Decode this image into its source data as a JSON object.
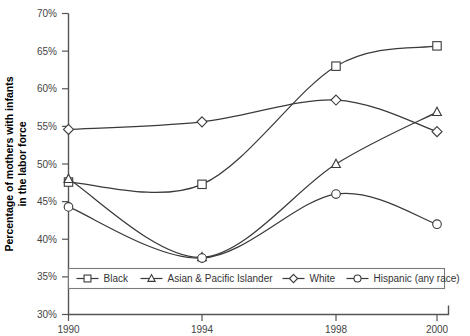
{
  "chart_data": {
    "type": "line",
    "title": "",
    "xlabel": "",
    "ylabel": "Percentage of mothers with infants in the labor force",
    "ylabel_line1": "Percentage of mothers with infants",
    "ylabel_line2": "in the labor force",
    "x": [
      1990,
      1994,
      1998,
      2000
    ],
    "categories": [
      "1990",
      "1994",
      "1998",
      "2000"
    ],
    "xtick_labels": [
      "1990",
      "1994",
      "1998",
      "2000"
    ],
    "ytick_labels": [
      "30%",
      "35%",
      "40%",
      "45%",
      "50%",
      "55%",
      "60%",
      "65%",
      "70%"
    ],
    "ytick_values": [
      30,
      35,
      40,
      45,
      50,
      55,
      60,
      65,
      70
    ],
    "ylim": [
      30,
      70
    ],
    "xlim": [
      1989.2,
      2000.6
    ],
    "grid": false,
    "legend_position": "bottom",
    "series": [
      {
        "name": "Black",
        "marker": "square",
        "values": [
          47.6,
          47.3,
          63.0,
          65.7
        ]
      },
      {
        "name": "Asian & Pacific Islander",
        "marker": "triangle",
        "values": [
          48.0,
          37.6,
          50.0,
          56.9
        ]
      },
      {
        "name": "White",
        "marker": "diamond",
        "values": [
          54.6,
          55.6,
          58.5,
          54.3
        ]
      },
      {
        "name": "Hispanic (any race)",
        "marker": "circle",
        "values": [
          44.3,
          37.5,
          46.0,
          42.0
        ]
      }
    ]
  },
  "legend": {
    "items": [
      {
        "label": "Black",
        "marker": "square"
      },
      {
        "label": "Asian & Pacific Islander",
        "marker": "triangle"
      },
      {
        "label": "White",
        "marker": "diamond"
      },
      {
        "label": "Hispanic (any race)",
        "marker": "circle"
      }
    ]
  },
  "colors": {
    "line": "#3a3a3a",
    "axis": "#555555",
    "marker_fill": "#ffffff",
    "legend_border": "#7a7a7a",
    "text": "#333333",
    "background": "#ffffff"
  }
}
